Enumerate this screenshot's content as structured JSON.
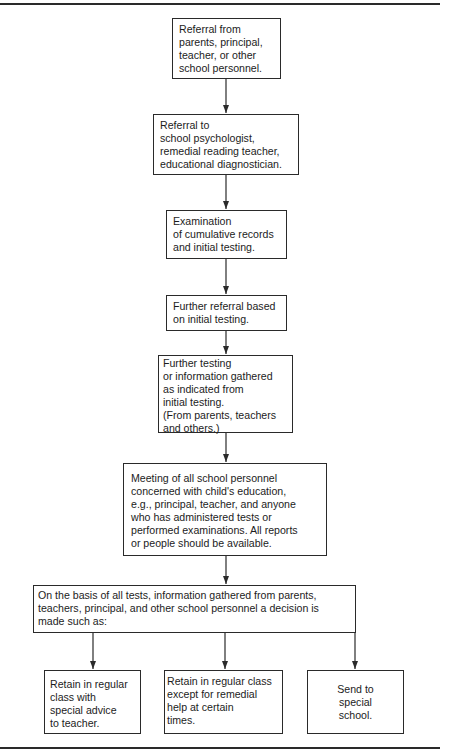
{
  "flowchart": {
    "nodes": [
      {
        "id": "referral-from",
        "lines": [
          "Referral from",
          "parents, principal,",
          "teacher, or other",
          "school personnel."
        ]
      },
      {
        "id": "referral-to",
        "lines": [
          "Referral to",
          "school psychologist,",
          "remedial reading teacher,",
          "educational diagnostician."
        ]
      },
      {
        "id": "examination",
        "lines": [
          "Examination",
          "of cumulative records",
          "and initial testing."
        ]
      },
      {
        "id": "further-referral",
        "lines": [
          "Further referral based",
          "on initial testing."
        ]
      },
      {
        "id": "further-testing",
        "lines": [
          "Further testing",
          "or information gathered",
          "as indicated from",
          "initial testing.",
          "(From parents, teachers",
          "and others.)"
        ]
      },
      {
        "id": "meeting",
        "lines": [
          "Meeting of all school personnel",
          "concerned with child's education,",
          "e.g., principal, teacher, and anyone",
          "who has administered tests or",
          "performed examinations. All reports",
          "or people should be available."
        ]
      },
      {
        "id": "decision",
        "lines": [
          "On the basis of all tests, information gathered from parents,",
          "teachers, principal, and other school personnel a decision is",
          "made such as:"
        ]
      },
      {
        "id": "retain-advice",
        "lines": [
          "Retain in regular",
          "class with",
          "special advice",
          "to teacher."
        ]
      },
      {
        "id": "retain-remedial",
        "lines": [
          "Retain in regular class",
          "except for remedial",
          "help at certain",
          "times."
        ]
      },
      {
        "id": "special-school",
        "lines": [
          "Send to",
          "special",
          "school."
        ]
      }
    ],
    "edges": [
      [
        "referral-from",
        "referral-to"
      ],
      [
        "referral-to",
        "examination"
      ],
      [
        "examination",
        "further-referral"
      ],
      [
        "further-referral",
        "further-testing"
      ],
      [
        "further-testing",
        "meeting"
      ],
      [
        "meeting",
        "decision"
      ],
      [
        "decision",
        "retain-advice"
      ],
      [
        "decision",
        "retain-remedial"
      ],
      [
        "decision",
        "special-school"
      ]
    ],
    "colors": {
      "line": "#2a2a2a",
      "text": "#1c1c1c",
      "background": "#ffffff"
    }
  }
}
